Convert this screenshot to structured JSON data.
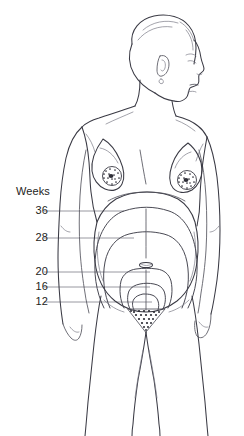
{
  "illustration": {
    "title": "Fundal height by week of pregnancy",
    "subject": "pregnant-female-figure-anterior-view",
    "background_color": "#ffffff",
    "outline_color": "#3a3a44",
    "leader_line_color": "#8d8d95"
  },
  "legend": {
    "header": "Weeks",
    "markers": [
      {
        "weeks": "36",
        "label_y": 211,
        "leader_x_start": 44,
        "leader_x_end": 122
      },
      {
        "weeks": "28",
        "label_y": 238,
        "leader_x_start": 44,
        "leader_x_end": 122
      },
      {
        "weeks": "20",
        "label_y": 272,
        "leader_x_start": 44,
        "leader_x_end": 122
      },
      {
        "weeks": "16",
        "label_y": 287,
        "leader_x_start": 44,
        "leader_x_end": 122
      },
      {
        "weeks": "12",
        "label_y": 302,
        "leader_x_start": 44,
        "leader_x_end": 122
      }
    ]
  },
  "anatomy": {
    "parts": [
      "head-profile-right-facing",
      "short-hair",
      "ear",
      "neck",
      "shoulders",
      "left-arm",
      "right-arm",
      "left-breast",
      "right-breast",
      "gravid-abdomen",
      "umbilicus",
      "linea-nigra",
      "pubic-triangle",
      "left-thigh",
      "right-thigh"
    ]
  }
}
